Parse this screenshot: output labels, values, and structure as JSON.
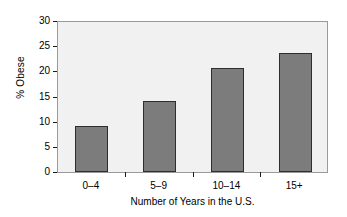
{
  "chart_data": {
    "type": "bar",
    "title": "",
    "subtitle": "",
    "categories": [
      "0–4",
      "5–9",
      "10–14",
      "15+"
    ],
    "values": [
      9.3,
      14.3,
      20.8,
      23.9
    ],
    "series": [
      {
        "name": "% Obese",
        "values": [
          9.3,
          14.3,
          20.8,
          23.9
        ]
      }
    ],
    "xlabel": "Number of Years in the U.S.",
    "ylabel": "% Obese",
    "ylim": [
      0,
      30
    ],
    "ytick_labels": [
      "0",
      "5",
      "10",
      "15",
      "20",
      "25",
      "30"
    ],
    "ytick_values": [
      0,
      5,
      10,
      15,
      20,
      25,
      30
    ],
    "grid": false,
    "legend": false,
    "legend_position": "none",
    "annotations": [],
    "colors": {
      "bar_fill": "#7c7c7c",
      "bar_edge": "#2e2e2e",
      "plot_background": "#f1f1f1",
      "frame": "#9a9a9a",
      "figure_background": "#ffffff",
      "text": "#000000"
    }
  }
}
